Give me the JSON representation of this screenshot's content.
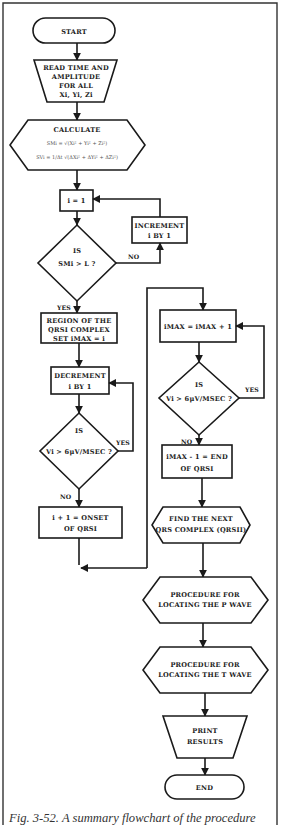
{
  "figure": {
    "caption": "Fig. 3-52. A summary flowchart of the procedure"
  },
  "nodes": {
    "start": {
      "label": "START"
    },
    "read": {
      "lines": [
        "READ TIME AND",
        "AMPLITUDE",
        "FOR ALL",
        "Xi,  Yi,  Zi"
      ]
    },
    "calculate": {
      "title": "CALCULATE",
      "formula_sm": "SMi = √(Xi² + Yi² + Zi²)",
      "formula_sv": "SVi = 1/Δt √(ΔXi² + ΔYi² + ΔZi²)"
    },
    "init_i": {
      "label": "i = 1"
    },
    "increment": {
      "lines": [
        "INCREMENT",
        "i  BY  1"
      ]
    },
    "decision_sm": {
      "lines": [
        "IS",
        "SMi > L ?"
      ]
    },
    "region": {
      "lines": [
        "REGION OF THE",
        "QRSI COMPLEX",
        "SET  iMAX  =  i"
      ]
    },
    "decrement": {
      "lines": [
        "DECREMENT",
        "i  BY  1"
      ]
    },
    "decision_v_left": {
      "lines": [
        "IS",
        "Vi > 6μV/MSEC ?"
      ]
    },
    "onset": {
      "lines": [
        "i + 1  =  ONSET",
        "OF  QRSI"
      ]
    },
    "imax_inc": {
      "label": "iMAX  =  iMAX + 1"
    },
    "decision_v_right": {
      "lines": [
        "IS",
        "Vi > 6μV/MSEC ?"
      ]
    },
    "end_qrs": {
      "lines": [
        "iMAX - 1  =  END",
        "OF  QRSI"
      ]
    },
    "find_next": {
      "lines": [
        "FIND THE NEXT",
        "QRS COMPLEX  (QRSII)"
      ]
    },
    "p_wave": {
      "lines": [
        "PROCEDURE FOR",
        "LOCATING THE  P WAVE"
      ]
    },
    "t_wave": {
      "lines": [
        "PROCEDURE FOR",
        "LOCATING THE  T WAVE"
      ]
    },
    "print": {
      "lines": [
        "PRINT",
        "RESULTS"
      ]
    },
    "end": {
      "label": "END"
    }
  },
  "edges": {
    "no_label": "NO",
    "yes_label": "YES"
  }
}
